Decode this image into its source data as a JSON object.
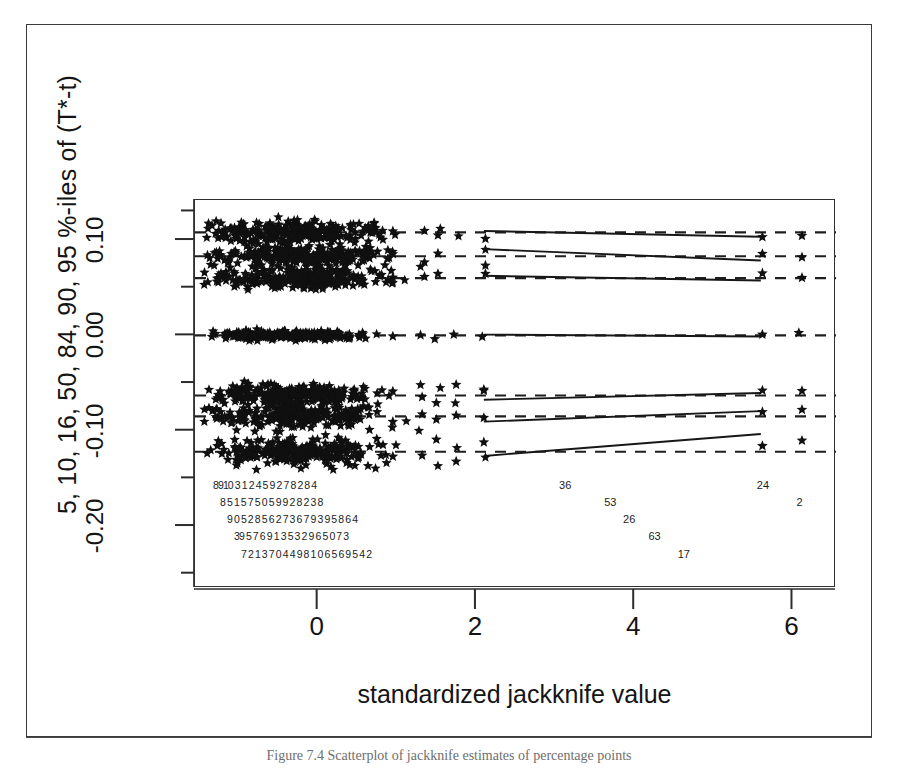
{
  "figure": {
    "caption": "Figure 7.4 Scatterplot of jackknife estimates of percentage points"
  },
  "chart_data": {
    "type": "scatter",
    "title": "",
    "xlabel": "standardized jackknife value",
    "ylabel": "5, 10, 16, 50, 84, 90, 95 %-iles of (T*-t)",
    "xlim": [
      -1.55,
      6.55
    ],
    "ylim": [
      -0.265,
      0.142
    ],
    "xticks": [
      0,
      2,
      4,
      6
    ],
    "xticklabels": [
      "0",
      "2",
      "4",
      "6"
    ],
    "yticks": [
      0.1,
      0.0,
      -0.1,
      -0.2
    ],
    "yticklabels": [
      "0.10",
      "0.00",
      "-0.10",
      "-0.20"
    ],
    "yminorticks": [
      0.13,
      0.05,
      -0.05,
      -0.15,
      -0.25
    ],
    "grid": false,
    "legend": null,
    "point_marker": "star",
    "series": [
      {
        "name": "95 %-ile",
        "reference_level": 0.108,
        "linetype": "dashed",
        "trend": {
          "x0": 2.1,
          "y0": 0.1095,
          "x1": 5.6,
          "y1": 0.1035
        },
        "cluster": {
          "x_center": -0.3,
          "x_spread": 0.95,
          "y_jitter": 0.01,
          "n": 240
        },
        "isolated_x": [
          0.95,
          1.35,
          1.52,
          2.12,
          5.62,
          6.12
        ]
      },
      {
        "name": "90 %-ile",
        "reference_level": 0.083,
        "linetype": "dashed",
        "trend": {
          "x0": 2.1,
          "y0": 0.0905,
          "x1": 5.6,
          "y1": 0.0785
        },
        "cluster": {
          "x_center": -0.3,
          "x_spread": 0.95,
          "y_jitter": 0.009,
          "n": 240
        },
        "isolated_x": [
          0.95,
          1.35,
          1.52,
          2.12,
          5.62,
          6.12
        ]
      },
      {
        "name": "84 %-ile",
        "reference_level": 0.06,
        "linetype": "dashed",
        "trend": {
          "x0": 2.1,
          "y0": 0.0625,
          "x1": 5.6,
          "y1": 0.0575
        },
        "cluster": {
          "x_center": -0.3,
          "x_spread": 0.95,
          "y_jitter": 0.009,
          "n": 240
        },
        "isolated_x": [
          0.95,
          1.35,
          1.52,
          2.12,
          5.62,
          6.12
        ]
      },
      {
        "name": "50 %-ile",
        "reference_level": 0.0,
        "linetype": "dashed",
        "trend": {
          "x0": 2.1,
          "y0": 0.0008,
          "x1": 5.6,
          "y1": -0.0012
        },
        "cluster": {
          "x_center": -0.42,
          "x_spread": 0.8,
          "y_jitter": 0.004,
          "n": 210
        },
        "isolated_x": [
          0.95,
          1.3,
          1.48,
          1.72,
          2.08,
          5.62,
          6.08
        ]
      },
      {
        "name": "16 %-ile",
        "reference_level": -0.063,
        "linetype": "dashed",
        "trend": {
          "x0": 2.1,
          "y0": -0.0675,
          "x1": 5.6,
          "y1": -0.0605
        },
        "cluster": {
          "x_center": -0.3,
          "x_spread": 0.95,
          "y_jitter": 0.009,
          "n": 240
        },
        "isolated_x": [
          0.95,
          1.32,
          1.5,
          1.75,
          2.1,
          5.62,
          6.12
        ]
      },
      {
        "name": "10 %-ile",
        "reference_level": -0.085,
        "linetype": "dashed",
        "trend": {
          "x0": 2.1,
          "y0": -0.0905,
          "x1": 5.6,
          "y1": -0.0795
        },
        "cluster": {
          "x_center": -0.3,
          "x_spread": 0.95,
          "y_jitter": 0.01,
          "n": 240
        },
        "isolated_x": [
          0.95,
          1.32,
          1.5,
          1.75,
          2.1,
          5.62,
          6.12
        ]
      },
      {
        "name": "5 %-ile",
        "reference_level": -0.122,
        "linetype": "dashed",
        "trend": {
          "x0": 2.1,
          "y0": -0.1265,
          "x1": 5.6,
          "y1": -0.1035
        },
        "cluster": {
          "x_center": -0.3,
          "x_spread": 0.95,
          "y_jitter": 0.012,
          "n": 240
        },
        "isolated_x": [
          0.95,
          1.32,
          1.5,
          1.75,
          2.1,
          5.62,
          6.12
        ]
      }
    ],
    "case_label_rows": [
      {
        "y": -0.158,
        "text": "8910 3 1 2 4 5 9 2 7 8 2 8 4",
        "outliers": [
          {
            "x": 3.05,
            "label": "36"
          },
          {
            "x": 5.55,
            "label": "24"
          }
        ]
      },
      {
        "y": -0.176,
        "text": "8 5 1 5 7 5 0 5 9 9 2 8 2 3 8",
        "outliers": [
          {
            "x": 3.62,
            "label": "53"
          },
          {
            "x": 6.05,
            "label": "2"
          }
        ]
      },
      {
        "y": -0.194,
        "text": "9 0 5 2 8 5 6 2 7 3 6 7 9 3 9 5 8 6 4",
        "outliers": [
          {
            "x": 3.86,
            "label": "26"
          }
        ]
      },
      {
        "y": -0.212,
        "text": "39 5 7 6 9 1 3 5 3 2 9 6 5 0 7 3",
        "outliers": [
          {
            "x": 4.18,
            "label": "63"
          }
        ]
      },
      {
        "y": -0.23,
        "text": "7 2 1 3 7 0 4 4 9 8 1 0 6 5 6 9 5 4 2",
        "outliers": [
          {
            "x": 4.55,
            "label": "17"
          }
        ]
      }
    ]
  }
}
